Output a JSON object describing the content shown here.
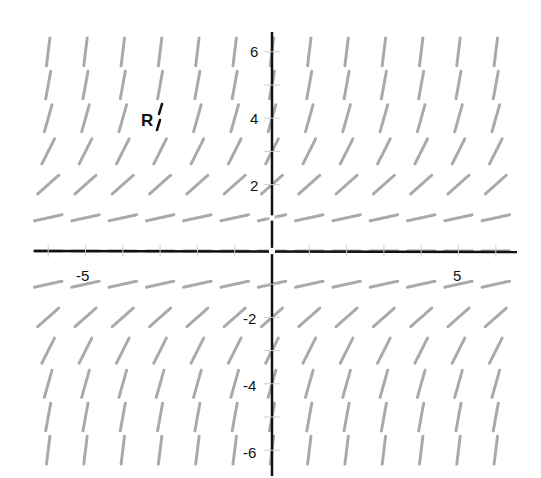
{
  "chart_data": {
    "type": "slope_field",
    "title": "",
    "xlabel": "",
    "ylabel": "",
    "equation_estimate": "dy/dx = y^2 / 4",
    "xlim": [
      -6.3,
      6.7
    ],
    "ylim": [
      -6.6,
      6.6
    ],
    "grid": false,
    "x_tick_labels": [
      {
        "value": -5,
        "label": "-5"
      },
      {
        "value": 5,
        "label": "5"
      }
    ],
    "y_tick_labels": [
      {
        "value": 6,
        "label": "6"
      },
      {
        "value": 4,
        "label": "4"
      },
      {
        "value": 2,
        "label": "2"
      },
      {
        "value": -2,
        "label": "-2"
      },
      {
        "value": -4,
        "label": "-4"
      },
      {
        "value": -6,
        "label": "-6"
      }
    ],
    "sample_x": [
      -6,
      -5,
      -4,
      -3,
      -2,
      -1,
      0,
      1,
      2,
      3,
      4,
      5,
      6
    ],
    "sample_y": [
      6,
      5,
      4,
      3,
      2,
      1,
      0,
      -1,
      -2,
      -3,
      -4,
      -5,
      -6
    ],
    "slopes_by_y": [
      {
        "y": 6,
        "slope": 9.0
      },
      {
        "y": 5,
        "slope": 6.25
      },
      {
        "y": 4,
        "slope": 4.0
      },
      {
        "y": 3,
        "slope": 2.25
      },
      {
        "y": 2,
        "slope": 1.0
      },
      {
        "y": 1,
        "slope": 0.25
      },
      {
        "y": 0,
        "slope": 0.0
      },
      {
        "y": -1,
        "slope": 0.25
      },
      {
        "y": -2,
        "slope": 1.0
      },
      {
        "y": -3,
        "slope": 2.25
      },
      {
        "y": -4,
        "slope": 4.0
      },
      {
        "y": -5,
        "slope": 6.25
      },
      {
        "y": -6,
        "slope": 9.0
      }
    ],
    "annotations": [
      {
        "label": "R",
        "x": -3,
        "y": 4,
        "note": "highlighted segment"
      }
    ]
  },
  "labels": {
    "x_neg5": "-5",
    "x_pos5": "5",
    "y_6": "6",
    "y_4": "4",
    "y_2": "2",
    "y_neg2": "-2",
    "y_neg4": "-4",
    "y_neg6": "-6",
    "annotation_r": "R"
  },
  "style": {
    "segment_color": "#a9a9a9",
    "axis_color": "#111111",
    "highlight_color": "#111111"
  }
}
